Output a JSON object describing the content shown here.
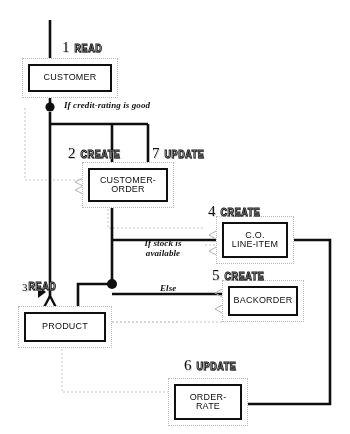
{
  "diagram": {
    "background_color": "#ffffff",
    "line_color": "#111111",
    "dotted_color": "#b9b9b9",
    "entities": [
      {
        "id": "customer",
        "label": "CUSTOMER"
      },
      {
        "id": "customer-order",
        "label": "CUSTOMER-\nORDER"
      },
      {
        "id": "co-line-item",
        "label": "C.O.\nLINE-ITEM"
      },
      {
        "id": "backorder",
        "label": "BACKORDER"
      },
      {
        "id": "product",
        "label": "PRODUCT"
      },
      {
        "id": "order-rate",
        "label": "ORDER-\nRATE"
      }
    ],
    "actions": [
      {
        "id": "action-1",
        "number": "1",
        "verb": "READ",
        "entity": "customer"
      },
      {
        "id": "action-2",
        "number": "2",
        "verb": "CREATE",
        "entity": "customer-order"
      },
      {
        "id": "action-7",
        "number": "7",
        "verb": "UPDATE",
        "entity": "customer-order"
      },
      {
        "id": "action-4",
        "number": "4",
        "verb": "CREATE",
        "entity": "co-line-item"
      },
      {
        "id": "action-5",
        "number": "5",
        "verb": "CREATE",
        "entity": "backorder"
      },
      {
        "id": "action-3",
        "number": "3",
        "verb": "READ",
        "entity": "product"
      },
      {
        "id": "action-6",
        "number": "6",
        "verb": "UPDATE",
        "entity": "order-rate"
      }
    ],
    "conditions": [
      {
        "id": "cond-credit",
        "text": "If credit-rating is good"
      },
      {
        "id": "cond-stock",
        "text": "If stock is\navailable"
      },
      {
        "id": "cond-else",
        "text": "Else"
      }
    ]
  }
}
